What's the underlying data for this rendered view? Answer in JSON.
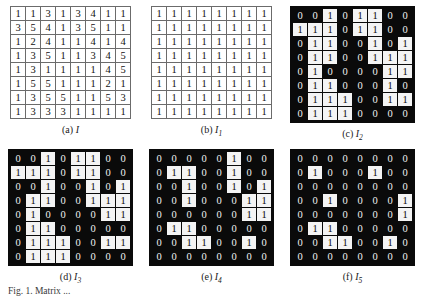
{
  "figure": {
    "caption_partial": "Fig. 1. Matrix ...",
    "panels": [
      {
        "id": "a",
        "label": "(a)",
        "symbol": "I",
        "subscript": "",
        "style": "light",
        "rows": 8,
        "cols": 8,
        "matrix": [
          [
            1,
            1,
            3,
            1,
            3,
            4,
            1,
            1
          ],
          [
            3,
            5,
            4,
            1,
            3,
            5,
            1,
            1
          ],
          [
            1,
            2,
            4,
            1,
            1,
            4,
            1,
            4
          ],
          [
            1,
            3,
            5,
            1,
            1,
            3,
            4,
            5
          ],
          [
            1,
            3,
            1,
            1,
            1,
            1,
            4,
            5
          ],
          [
            1,
            5,
            5,
            1,
            1,
            1,
            2,
            1
          ],
          [
            1,
            3,
            5,
            5,
            1,
            1,
            5,
            3
          ],
          [
            1,
            3,
            3,
            3,
            1,
            1,
            1,
            1
          ]
        ]
      },
      {
        "id": "b",
        "label": "(b)",
        "symbol": "I",
        "subscript": "1",
        "style": "light",
        "rows": 8,
        "cols": 8,
        "matrix": [
          [
            1,
            1,
            1,
            1,
            1,
            1,
            1,
            1
          ],
          [
            1,
            1,
            1,
            1,
            1,
            1,
            1,
            1
          ],
          [
            1,
            1,
            1,
            1,
            1,
            1,
            1,
            1
          ],
          [
            1,
            1,
            1,
            1,
            1,
            1,
            1,
            1
          ],
          [
            1,
            1,
            1,
            1,
            1,
            1,
            1,
            1
          ],
          [
            1,
            1,
            1,
            1,
            1,
            1,
            1,
            1
          ],
          [
            1,
            1,
            1,
            1,
            1,
            1,
            1,
            1
          ],
          [
            1,
            1,
            1,
            1,
            1,
            1,
            1,
            1
          ]
        ]
      },
      {
        "id": "c",
        "label": "(c)",
        "symbol": "I",
        "subscript": "2",
        "style": "dark",
        "rows": 8,
        "cols": 8,
        "matrix": [
          [
            0,
            0,
            1,
            0,
            1,
            1,
            0,
            0
          ],
          [
            1,
            1,
            1,
            0,
            1,
            1,
            0,
            0
          ],
          [
            0,
            1,
            1,
            0,
            0,
            1,
            0,
            1
          ],
          [
            0,
            1,
            1,
            0,
            0,
            1,
            1,
            1
          ],
          [
            0,
            1,
            0,
            0,
            0,
            0,
            1,
            1
          ],
          [
            0,
            1,
            1,
            0,
            0,
            0,
            1,
            0
          ],
          [
            0,
            1,
            1,
            1,
            0,
            0,
            1,
            1
          ],
          [
            0,
            1,
            1,
            1,
            0,
            0,
            0,
            0
          ]
        ]
      },
      {
        "id": "d",
        "label": "(d)",
        "symbol": "I",
        "subscript": "3",
        "style": "dark",
        "rows": 8,
        "cols": 8,
        "matrix": [
          [
            0,
            0,
            1,
            0,
            1,
            1,
            0,
            0
          ],
          [
            1,
            1,
            1,
            0,
            1,
            1,
            0,
            0
          ],
          [
            0,
            0,
            1,
            0,
            0,
            1,
            0,
            1
          ],
          [
            0,
            1,
            1,
            0,
            0,
            1,
            1,
            1
          ],
          [
            0,
            1,
            0,
            0,
            0,
            0,
            1,
            1
          ],
          [
            0,
            1,
            1,
            0,
            0,
            0,
            0,
            0
          ],
          [
            0,
            1,
            1,
            1,
            0,
            0,
            1,
            1
          ],
          [
            0,
            1,
            1,
            1,
            0,
            0,
            0,
            0
          ]
        ]
      },
      {
        "id": "e",
        "label": "(e)",
        "symbol": "I",
        "subscript": "4",
        "style": "dark",
        "rows": 8,
        "cols": 8,
        "matrix": [
          [
            0,
            0,
            0,
            0,
            0,
            1,
            0,
            0
          ],
          [
            0,
            1,
            1,
            0,
            0,
            1,
            0,
            0
          ],
          [
            0,
            0,
            1,
            0,
            0,
            1,
            0,
            1
          ],
          [
            0,
            0,
            1,
            0,
            0,
            0,
            1,
            1
          ],
          [
            0,
            0,
            0,
            0,
            0,
            0,
            1,
            1
          ],
          [
            0,
            1,
            1,
            0,
            0,
            0,
            0,
            0
          ],
          [
            0,
            0,
            1,
            1,
            0,
            0,
            1,
            0
          ],
          [
            0,
            0,
            0,
            0,
            0,
            0,
            0,
            0
          ]
        ]
      },
      {
        "id": "f",
        "label": "(f)",
        "symbol": "I",
        "subscript": "5",
        "style": "dark",
        "rows": 8,
        "cols": 8,
        "matrix": [
          [
            0,
            0,
            0,
            0,
            0,
            0,
            0,
            0
          ],
          [
            0,
            1,
            0,
            0,
            0,
            1,
            0,
            0
          ],
          [
            0,
            0,
            0,
            0,
            0,
            0,
            0,
            0
          ],
          [
            0,
            0,
            1,
            0,
            0,
            0,
            0,
            1
          ],
          [
            0,
            0,
            0,
            0,
            0,
            0,
            0,
            1
          ],
          [
            0,
            1,
            1,
            0,
            0,
            0,
            0,
            0
          ],
          [
            0,
            0,
            1,
            1,
            0,
            0,
            1,
            0
          ],
          [
            0,
            0,
            0,
            0,
            0,
            0,
            0,
            0
          ]
        ]
      }
    ]
  }
}
